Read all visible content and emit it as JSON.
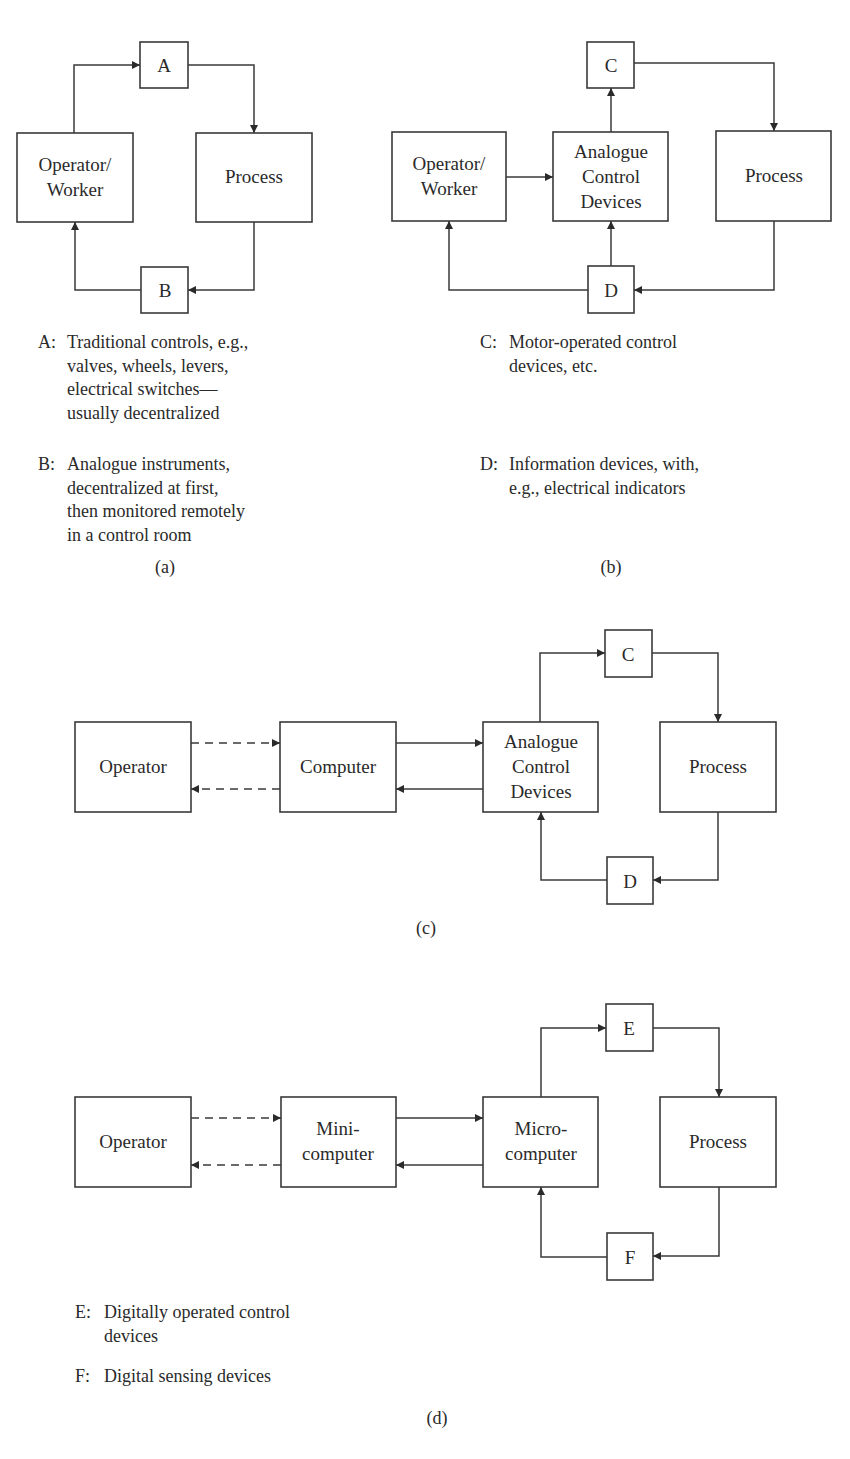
{
  "figure": {
    "panels": [
      {
        "id": "a",
        "caption": "(a)",
        "blocks": {
          "control": "A",
          "operator": "Operator/\nWorker",
          "operator_line1": "Operator/",
          "operator_line2": "Worker",
          "process": "Process",
          "info": "B"
        },
        "legend": [
          {
            "key": "A:",
            "text": "Traditional controls, e.g.,\nvalves, wheels, levers,\nelectrical switches—\nusually decentralized"
          },
          {
            "key": "B:",
            "text": "Analogue instruments,\ndecentralized at first,\nthen monitored remotely\nin a control room"
          }
        ]
      },
      {
        "id": "b",
        "caption": "(b)",
        "blocks": {
          "control": "C",
          "operator_line1": "Operator/",
          "operator_line2": "Worker",
          "analogue_line1": "Analogue",
          "analogue_line2": "Control",
          "analogue_line3": "Devices",
          "process": "Process",
          "info": "D"
        },
        "legend": [
          {
            "key": "C:",
            "text": "Motor-operated control\ndevices, etc."
          },
          {
            "key": "D:",
            "text": "Information devices, with,\ne.g., electrical indicators"
          }
        ]
      },
      {
        "id": "c",
        "caption": "(c)",
        "blocks": {
          "operator": "Operator",
          "computer": "Computer",
          "analogue_line1": "Analogue",
          "analogue_line2": "Control",
          "analogue_line3": "Devices",
          "control": "C",
          "process": "Process",
          "info": "D"
        }
      },
      {
        "id": "d",
        "caption": "(d)",
        "blocks": {
          "operator": "Operator",
          "mini_line1": "Mini-",
          "mini_line2": "computer",
          "micro_line1": "Micro-",
          "micro_line2": "computer",
          "control": "E",
          "process": "Process",
          "info": "F"
        },
        "legend": [
          {
            "key": "E:",
            "text": "Digitally operated control\ndevices"
          },
          {
            "key": "F:",
            "text": "Digital sensing devices"
          }
        ]
      }
    ],
    "colors": {
      "line": "#3a3a3a",
      "text": "#2a2a2a",
      "background": "#ffffff"
    }
  }
}
